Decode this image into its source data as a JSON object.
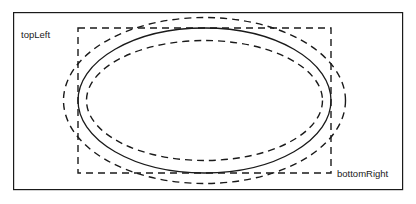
{
  "figure": {
    "background_color": "#ffffff",
    "stroke_color": "#1a1a1a",
    "frame": {
      "name": "outer-frame",
      "x": 13,
      "y": 12,
      "width": 390,
      "height": 178,
      "stroke_width": 1.2,
      "style": "solid"
    },
    "bounding_box": {
      "name": "ellipse-bounding-box",
      "x": 78,
      "y": 28,
      "width": 253,
      "height": 145,
      "stroke_width": 1.4,
      "style": "dashed",
      "dash_pattern": "7,5"
    },
    "ellipses": [
      {
        "name": "outer-dashed-ellipse",
        "cx": 204.5,
        "cy": 100.5,
        "rx": 141,
        "ry": 83,
        "style": "dashed",
        "dash_pattern": "7,5",
        "stroke_width": 1.4
      },
      {
        "name": "solid-ellipse",
        "cx": 204.5,
        "cy": 100.5,
        "rx": 126.5,
        "ry": 72.5,
        "style": "solid",
        "dash_pattern": "",
        "stroke_width": 1.3
      },
      {
        "name": "inner-dashed-ellipse",
        "cx": 204.5,
        "cy": 100.5,
        "rx": 118,
        "ry": 60,
        "style": "dashed",
        "dash_pattern": "7,5",
        "stroke_width": 1.4
      }
    ],
    "labels": {
      "top_left": {
        "text": "topLeft",
        "x": 21,
        "y": 38
      },
      "bottom_right": {
        "text": "bottomRight",
        "x": 337,
        "y": 177
      }
    }
  }
}
